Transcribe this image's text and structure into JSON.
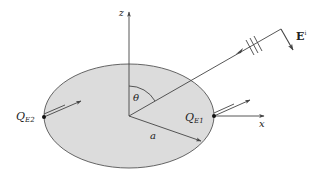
{
  "diagram": {
    "colors": {
      "disk_fill": "#dcdcdc",
      "stroke": "#444444",
      "background": "#ffffff"
    },
    "labels": {
      "z_axis": "z",
      "x_axis": "x",
      "angle": "θ",
      "radius": "a",
      "field_base": "E",
      "field_sup": "i",
      "q1_base": "Q",
      "q1_sub": "E1",
      "q2_base": "Q",
      "q2_sub": "E2"
    },
    "elements": [
      "elliptical-disk",
      "z-axis-arrow",
      "x-axis-arrow",
      "incidence-direction-line",
      "wavefront-ticks",
      "incident-field-arrow",
      "theta-angle-arc",
      "radius-arrow",
      "point-QE1",
      "point-QE2",
      "edge-current-arrows-QE1",
      "edge-current-arrows-QE2"
    ]
  }
}
